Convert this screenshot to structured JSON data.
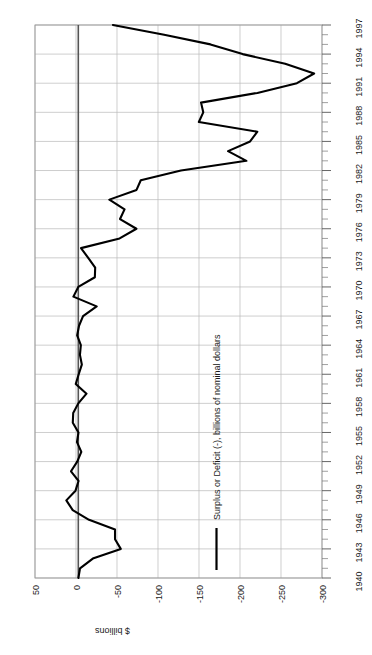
{
  "chart_data": {
    "type": "line",
    "title": "",
    "subtitle": "",
    "orientation": "rotated-90-ccw",
    "xlabel": "",
    "ylabel": "$ billions",
    "ylim": [
      50,
      -300
    ],
    "xlim": [
      1940,
      1997
    ],
    "grid": true,
    "legend_position": "inside-lower-right",
    "legend": [
      "Surplus or Deficit (-), billions of nominal dollars"
    ],
    "y_tick_labels": [
      "50",
      "0",
      "-50",
      "-100",
      "-150",
      "-200",
      "-250",
      "-300"
    ],
    "y_ticks": [
      50,
      0,
      -50,
      -100,
      -150,
      -200,
      -250,
      -300
    ],
    "x_tick_labels": [
      "1940",
      "1943",
      "1946",
      "1949",
      "1952",
      "1955",
      "1958",
      "1961",
      "1964",
      "1967",
      "1970",
      "1973",
      "1976",
      "1979",
      "1982",
      "1985",
      "1988",
      "1991",
      "1994",
      "1997"
    ],
    "x_ticks": [
      1940,
      1943,
      1946,
      1949,
      1952,
      1955,
      1958,
      1961,
      1964,
      1967,
      1970,
      1973,
      1976,
      1979,
      1982,
      1985,
      1988,
      1991,
      1994,
      1997
    ],
    "series": [
      {
        "name": "Surplus or Deficit (-), billions of nominal dollars",
        "color": "#000000",
        "x": [
          1940,
          1941,
          1942,
          1943,
          1944,
          1945,
          1946,
          1947,
          1948,
          1949,
          1950,
          1951,
          1952,
          1953,
          1954,
          1955,
          1956,
          1957,
          1958,
          1959,
          1960,
          1961,
          1962,
          1963,
          1964,
          1965,
          1966,
          1967,
          1968,
          1969,
          1970,
          1971,
          1972,
          1973,
          1974,
          1975,
          1976,
          1977,
          1978,
          1979,
          1980,
          1981,
          1982,
          1983,
          1984,
          1985,
          1986,
          1987,
          1988,
          1989,
          1990,
          1991,
          1992,
          1993,
          1994,
          1995,
          1996,
          1997
        ],
        "y": [
          -2.9,
          -4.9,
          -20.5,
          -54.6,
          -47.6,
          -47.6,
          -15.9,
          4.0,
          11.8,
          0.6,
          -3.1,
          6.1,
          -1.5,
          -6.5,
          -1.2,
          -3.0,
          3.9,
          3.4,
          -2.8,
          -12.8,
          0.3,
          -3.3,
          -7.1,
          -4.8,
          -5.9,
          -1.4,
          -3.7,
          -8.6,
          -25.2,
          3.2,
          -2.8,
          -23.0,
          -23.4,
          -14.9,
          -6.1,
          -53.2,
          -73.7,
          -53.7,
          -59.2,
          -40.7,
          -73.8,
          -79.0,
          -128.0,
          -207.8,
          -185.4,
          -212.3,
          -221.2,
          -149.8,
          -155.2,
          -152.5,
          -221.2,
          -269.4,
          -290.4,
          -255.1,
          -203.2,
          -164.0,
          -107.5,
          -45.0
        ]
      }
    ]
  },
  "axes": {
    "value_axis_title": "$ billions",
    "value_axis_labels": [
      "50",
      "0",
      "-50",
      "-100",
      "-150",
      "-200",
      "-250",
      "-300"
    ],
    "year_axis_labels": [
      "1940",
      "1943",
      "1946",
      "1949",
      "1952",
      "1955",
      "1958",
      "1961",
      "1964",
      "1967",
      "1970",
      "1973",
      "1976",
      "1979",
      "1982",
      "1985",
      "1988",
      "1991",
      "1994",
      "1997"
    ]
  },
  "legend": {
    "entries": [
      {
        "label": "Surplus or Deficit (-), billions of nominal dollars",
        "color": "#000000"
      }
    ]
  },
  "colors": {
    "line": "#000000",
    "grid": "#b9b9b9",
    "zero_axis": "#555555",
    "border": "#9a9a9a",
    "background": "#ffffff",
    "text": "#1a1a1a"
  }
}
